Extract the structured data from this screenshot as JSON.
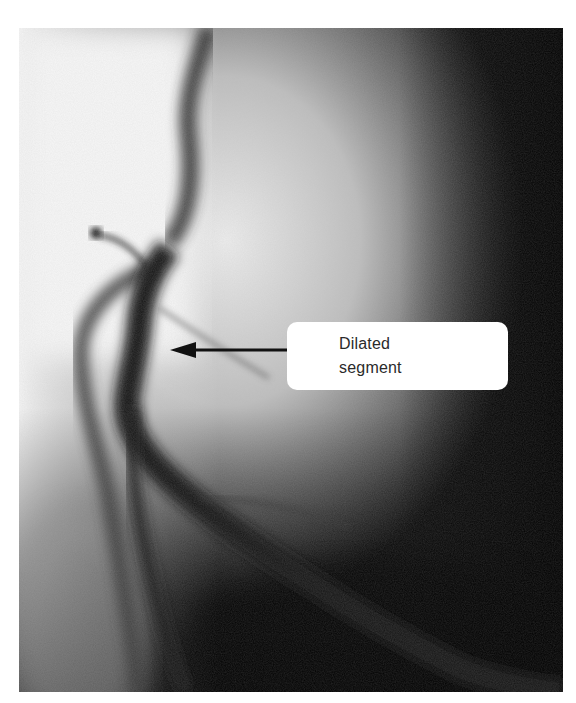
{
  "figure": {
    "type": "coronary angiogram",
    "tone": "grayscale",
    "annotation": {
      "line1": "Dilated",
      "line2": "segment",
      "pointer": "arrow pointing left to vessel segment"
    },
    "colors": {
      "background": "#ffffff",
      "label_box": "#ffffff",
      "label_text": "#2a2a2a",
      "arrow": "#111111",
      "vessel": "#1a1a1a",
      "dark_region": "#050505",
      "light_region": "#e8e8e8"
    }
  }
}
